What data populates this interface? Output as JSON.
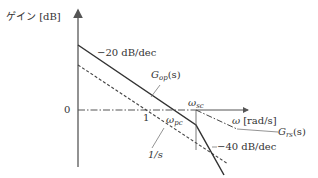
{
  "diagram": {
    "type": "bode-gain-asymptote",
    "y_axis_label": "ゲイン [dB]",
    "x_axis_label_symbol": "ω",
    "x_axis_label_unit": "[rad/s]",
    "zero_label": "0",
    "one_label": "1",
    "slope_upper": "−20 dB/dec",
    "slope_lower": "−40 dB/dec",
    "curves": {
      "gop": {
        "main": "G",
        "sub": "op",
        "arg": "(s)"
      },
      "grs": {
        "main": "G",
        "sub": "rs",
        "arg": "(s)"
      },
      "integrator": "1/s"
    },
    "markers": {
      "wpc": {
        "main": "ω",
        "sub": "pc"
      },
      "wsc": {
        "main": "ω",
        "sub": "sc"
      }
    },
    "colors": {
      "line": "#333333",
      "text": "#333333",
      "axis": "#666666"
    }
  }
}
